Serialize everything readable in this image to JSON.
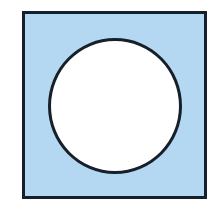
{
  "figure": {
    "caption": "Light blue square with a white circle inscribed",
    "background_color": "#ffffff",
    "canvas": {
      "width": 210,
      "height": 215
    },
    "shapes": {
      "square": {
        "name": "square",
        "fill_color": "#b4d8f2",
        "stroke_color": "#16202c",
        "stroke_width": 3,
        "x": 22,
        "y": 11,
        "width": 185,
        "height": 188
      },
      "circle": {
        "name": "circle",
        "fill_color": "#ffffff",
        "stroke_color": "#171f2b",
        "stroke_width": 3,
        "center_x": 115,
        "center_y": 106,
        "radius_x": 67,
        "radius_y": 68
      }
    }
  }
}
